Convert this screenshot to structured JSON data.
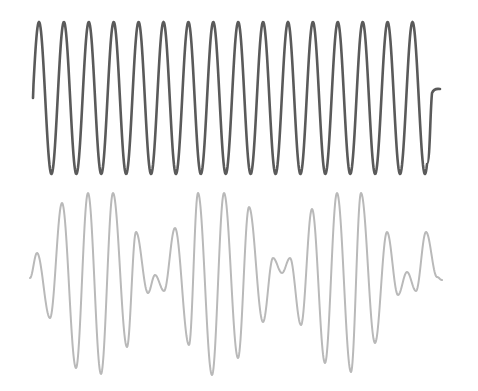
{
  "figure": {
    "width": 478,
    "height": 391,
    "background": "#ffffff"
  },
  "waves": {
    "carrier": {
      "label": "pure sine wave",
      "color": "#5a5a5a",
      "stroke_width": 2.6,
      "start": {
        "x": 33,
        "y": 98
      },
      "first_peak_x": 39,
      "peak_y": 22,
      "trough_y": 174,
      "period": 24.9,
      "cycles": 16,
      "last_trough_x": 427,
      "tail": {
        "x": 440,
        "y": 89
      }
    },
    "modulated": {
      "label": "modulated / beat wave",
      "color": "#b9b9b9",
      "stroke_width": 2.0,
      "extrema": [
        [
          30,
          278
        ],
        [
          37,
          253
        ],
        [
          50,
          318
        ],
        [
          62,
          203
        ],
        [
          76,
          368
        ],
        [
          88,
          193
        ],
        [
          101,
          374
        ],
        [
          113,
          193
        ],
        [
          127,
          347
        ],
        [
          136,
          232
        ],
        [
          148,
          293
        ],
        [
          155,
          275
        ],
        [
          164,
          291
        ],
        [
          175,
          228
        ],
        [
          189,
          345
        ],
        [
          198,
          193
        ],
        [
          212,
          375
        ],
        [
          224,
          193
        ],
        [
          238,
          358
        ],
        [
          249,
          207
        ],
        [
          263,
          322
        ],
        [
          273,
          258
        ],
        [
          282,
          273
        ],
        [
          290,
          258
        ],
        [
          301,
          325
        ],
        [
          312,
          209
        ],
        [
          325,
          363
        ],
        [
          337,
          193
        ],
        [
          351,
          372
        ],
        [
          361,
          193
        ],
        [
          375,
          343
        ],
        [
          387,
          232
        ],
        [
          398,
          295
        ],
        [
          407,
          272
        ],
        [
          416,
          291
        ],
        [
          426,
          232
        ],
        [
          437,
          277
        ],
        [
          442,
          280
        ]
      ]
    }
  }
}
